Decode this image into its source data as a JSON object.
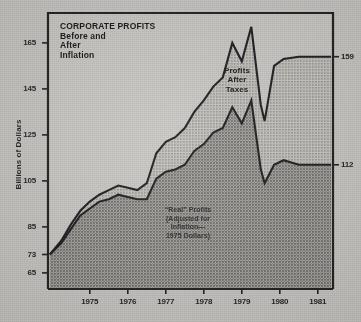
{
  "chart_data": {
    "type": "area",
    "title": "CORPORATE PROFITS\nBefore and\nAfter\nInflation",
    "title_lines": [
      "CORPORATE PROFITS",
      "Before and",
      "After",
      "Inflation"
    ],
    "ylabel": "Billions of Dollars",
    "xlabel": "",
    "grid": false,
    "legend_position": "inline-annotation",
    "ylim": [
      58,
      178
    ],
    "y_ticks": [
      165,
      145,
      125,
      105,
      85,
      73,
      65
    ],
    "y_tick_labels": [
      "165",
      "145",
      "125",
      "105",
      "85",
      "73",
      "65"
    ],
    "right_labels": [
      {
        "value": 159,
        "text": "159"
      },
      {
        "value": 112,
        "text": "112"
      }
    ],
    "categories": [
      "1975",
      "1976",
      "1977",
      "1978",
      "1979",
      "1980",
      "1981"
    ],
    "x_tick_labels": [
      "1975",
      "1976",
      "1977",
      "1978",
      "1979",
      "1980",
      "1981"
    ],
    "xlim": [
      1974.4,
      1981.9
    ],
    "annotations": [
      {
        "text": "Profits\nAfter\nTaxes",
        "x": 1978.6,
        "y": 150
      },
      {
        "text": "“Real” Profits\n(Adjusted for\nInflation—\n1975 Dollars)",
        "x": 1977.2,
        "y": 88
      }
    ],
    "series": [
      {
        "name": "Profits After Taxes",
        "color": "#adaca7",
        "x": [
          1974.45,
          1974.75,
          1975.0,
          1975.25,
          1975.5,
          1975.75,
          1976.0,
          1976.25,
          1976.5,
          1976.75,
          1977.0,
          1977.25,
          1977.5,
          1977.75,
          1978.0,
          1978.25,
          1978.5,
          1978.75,
          1979.0,
          1979.25,
          1979.5,
          1979.75,
          1980.0,
          1980.1,
          1980.35,
          1980.6,
          1981.0,
          1981.85
        ],
        "values": [
          73,
          79,
          86,
          92,
          96,
          99,
          101,
          103,
          102,
          101,
          104,
          117,
          122,
          124,
          128,
          135,
          140,
          146,
          150,
          165,
          157,
          172,
          138,
          131,
          155,
          158,
          159,
          159
        ]
      },
      {
        "name": "“Real” Profits (1975 Dollars)",
        "color": "#8e8d88",
        "x": [
          1974.45,
          1974.75,
          1975.0,
          1975.25,
          1975.5,
          1975.75,
          1976.0,
          1976.25,
          1976.5,
          1976.75,
          1977.0,
          1977.25,
          1977.5,
          1977.75,
          1978.0,
          1978.25,
          1978.5,
          1978.75,
          1979.0,
          1979.25,
          1979.5,
          1979.75,
          1980.0,
          1980.1,
          1980.35,
          1980.6,
          1981.0,
          1981.85
        ],
        "values": [
          73,
          78,
          84,
          90,
          93,
          96,
          97,
          99,
          98,
          97,
          97,
          106,
          109,
          110,
          112,
          118,
          121,
          126,
          128,
          137,
          130,
          140,
          110,
          104,
          112,
          114,
          112,
          112
        ]
      }
    ],
    "endpoints": {
      "start_value": 73,
      "nominal_end_value": 159,
      "real_end_value": 112
    }
  }
}
